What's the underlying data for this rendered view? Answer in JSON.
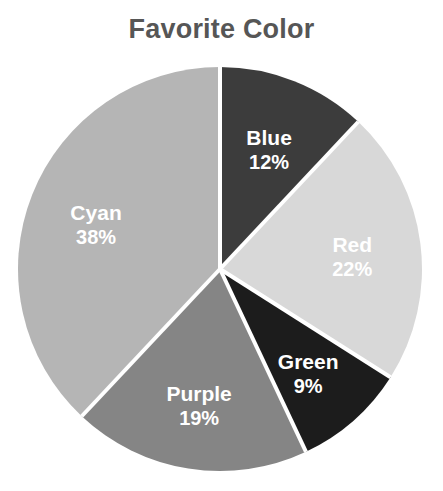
{
  "chart_data": {
    "type": "pie",
    "title": "Favorite Color",
    "xlabel": "",
    "ylabel": "",
    "legend": "none",
    "grid": false,
    "unit": "%",
    "start_angle_deg": 0,
    "direction": "clockwise",
    "categories": [
      "Blue",
      "Red",
      "Green",
      "Purple",
      "Cyan"
    ],
    "values": [
      12,
      22,
      9,
      19,
      38
    ],
    "labels": [
      "12%",
      "22%",
      "9%",
      "19%",
      "38%"
    ],
    "slices": [
      {
        "name": "Blue",
        "value": 12,
        "label": "12%",
        "color": "#3c3c3c"
      },
      {
        "name": "Red",
        "value": 22,
        "label": "22%",
        "color": "#d8d8d8"
      },
      {
        "name": "Green",
        "value": 9,
        "label": "9%",
        "color": "#1c1c1c"
      },
      {
        "name": "Purple",
        "value": 19,
        "label": "19%",
        "color": "#858585"
      },
      {
        "name": "Cyan",
        "value": 38,
        "label": "38%",
        "color": "#b5b5b5"
      }
    ],
    "colors": [
      "#3c3c3c",
      "#d8d8d8",
      "#1c1c1c",
      "#858585",
      "#b5b5b5"
    ],
    "label_color": "#ffffff",
    "separator_color": "#ffffff",
    "title_color": "#565656",
    "background": "#ffffff"
  },
  "geometry": {
    "cx": 220,
    "cy": 269,
    "r": 202,
    "separator_width": 4,
    "label_radius_factor": 0.66
  }
}
